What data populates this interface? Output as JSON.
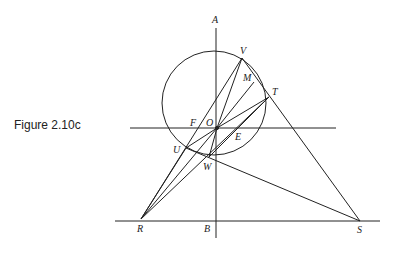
{
  "caption": "Figure 2.10c",
  "figure": {
    "circle": {
      "cx": 214,
      "cy": 103,
      "r": 52
    },
    "points": {
      "A": {
        "x": 216,
        "y": 27,
        "lx": 212,
        "ly": 23
      },
      "V": {
        "x": 242,
        "y": 58,
        "lx": 240,
        "ly": 54
      },
      "M": {
        "x": 254,
        "y": 82,
        "lx": 243,
        "ly": 81
      },
      "T": {
        "x": 269,
        "y": 97,
        "lx": 272,
        "ly": 95
      },
      "F": {
        "x": 203,
        "y": 128,
        "lx": 190,
        "ly": 126
      },
      "O": {
        "x": 217,
        "y": 128,
        "lx": 206,
        "ly": 126
      },
      "E": {
        "x": 238,
        "y": 128,
        "lx": 235,
        "ly": 140
      },
      "U": {
        "x": 186,
        "y": 148,
        "lx": 173,
        "ly": 153
      },
      "W": {
        "x": 209,
        "y": 157,
        "lx": 203,
        "ly": 170
      },
      "R": {
        "x": 141,
        "y": 219,
        "lx": 137,
        "ly": 232
      },
      "B": {
        "x": 216,
        "y": 221,
        "lx": 204,
        "ly": 232
      },
      "S": {
        "x": 360,
        "y": 221,
        "lx": 357,
        "ly": 233
      }
    },
    "labels": [
      "A",
      "V",
      "M",
      "T",
      "F",
      "O",
      "E",
      "U",
      "W",
      "R",
      "B",
      "S"
    ]
  }
}
